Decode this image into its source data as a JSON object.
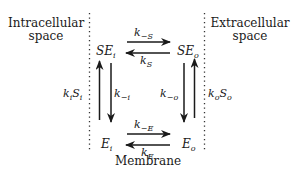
{
  "regions": {
    "left": [
      "Intracellular",
      "space"
    ],
    "right": [
      "Extracellular",
      "space"
    ],
    "bottom": "Membrane"
  },
  "species": {
    "SE_i": {
      "main": "SE",
      "sub": "i"
    },
    "SE_o": {
      "main": "SE",
      "sub": "o"
    },
    "E_i": {
      "main": "E",
      "sub": "i"
    },
    "E_o": {
      "main": "E",
      "sub": "o"
    }
  },
  "rates": {
    "top_forward": {
      "main": "k",
      "sub": "−S"
    },
    "top_backward": {
      "main": "k",
      "sub": "S"
    },
    "bottom_forward": {
      "main": "k",
      "sub": "−E"
    },
    "bottom_backward": {
      "main": "k",
      "sub": "E"
    },
    "left_up": {
      "main": "k",
      "sub1": "i",
      "main2": "S",
      "sub2": "i"
    },
    "left_down": {
      "main": "k",
      "sub": "−i"
    },
    "right_down": {
      "main": "k",
      "sub": "−o"
    },
    "right_up": {
      "main": "k",
      "sub1": "o",
      "main2": "S",
      "sub2": "o"
    }
  },
  "colors": {
    "ink": "#1a1a1a",
    "dots": "#333333"
  }
}
